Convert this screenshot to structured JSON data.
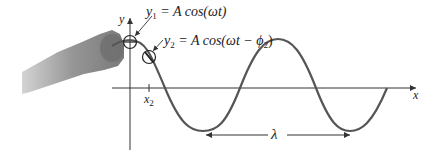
{
  "diagram": {
    "type": "wave-on-string",
    "equation_1": {
      "lhs": "y",
      "lhs_sub": "1",
      "rhs": "= A cos(ωt)"
    },
    "equation_2": {
      "lhs": "y",
      "lhs_sub": "2",
      "rhs": "= A cos(ωt − ϕ",
      "rhs_sub": "2",
      "rhs_end": ")"
    },
    "axes": {
      "x_label": "x",
      "y_label": "y"
    },
    "tick": {
      "label": "x",
      "label_sub": "2"
    },
    "wavelength_label": "λ",
    "colors": {
      "wave": "#555555",
      "axis": "#333333",
      "text": "#222222"
    }
  }
}
